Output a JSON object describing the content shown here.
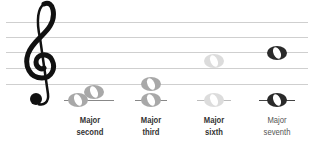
{
  "staff": {
    "line_color": "#cfcfcf",
    "lines_y": [
      22,
      37,
      52,
      68,
      84
    ],
    "clef": "treble-clef"
  },
  "intervals": [
    {
      "name_line1": "Major",
      "name_line2": "second",
      "color": "#a8a8a8",
      "label_color": "#333333"
    },
    {
      "name_line1": "Major",
      "name_line2": "third",
      "color": "#a8a8a8",
      "label_color": "#333333"
    },
    {
      "name_line1": "Major",
      "name_line2": "sixth",
      "color": "#dcdcdc",
      "label_color": "#333333"
    },
    {
      "name_line1": "Major",
      "name_line2": "seventh",
      "color": "#2a2a2a",
      "label_color": "#555555"
    }
  ]
}
